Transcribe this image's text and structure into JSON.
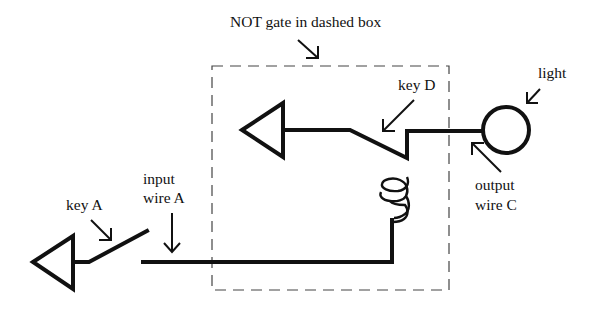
{
  "diagram": {
    "type": "circuit",
    "title_label": "NOT gate in dashed box",
    "labels": {
      "key_d": "key D",
      "light": "light",
      "output_line1": "output",
      "output_line2": "wire C",
      "input_line1": "input",
      "input_line2": "wire A",
      "key_a": "key A"
    },
    "components": [
      {
        "id": "ground-triangle-left",
        "kind": "ground/power triangle"
      },
      {
        "id": "key-a",
        "kind": "switch",
        "state": "open"
      },
      {
        "id": "input-wire-a",
        "kind": "wire"
      },
      {
        "id": "coil",
        "kind": "electromagnet coil"
      },
      {
        "id": "ground-triangle-gate",
        "kind": "ground/power triangle"
      },
      {
        "id": "key-d",
        "kind": "switch",
        "state": "closed"
      },
      {
        "id": "output-wire-c",
        "kind": "wire"
      },
      {
        "id": "light",
        "kind": "bulb"
      }
    ],
    "colors": {
      "ink": "#111111",
      "background": "#ffffff",
      "dash": "#444444"
    }
  }
}
